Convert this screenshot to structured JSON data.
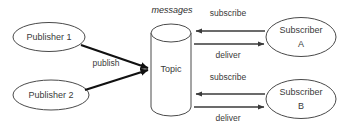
{
  "diagram": {
    "type": "publish-subscribe-messaging-diagram",
    "background_color": "#ffffff",
    "stroke_color": "#4a4a4a",
    "text_color": "#3a3a3a",
    "title": {
      "text": "messages",
      "style": "italic"
    },
    "nodes": [
      {
        "id": "publisher-1",
        "shape": "ellipse",
        "label": "Publisher 1",
        "cx": 49,
        "cy": 37,
        "rx": 36,
        "ry": 15
      },
      {
        "id": "publisher-2",
        "shape": "ellipse",
        "label": "Publisher 2",
        "cx": 51,
        "cy": 95,
        "rx": 38,
        "ry": 15
      },
      {
        "id": "topic",
        "shape": "cylinder",
        "label": "Topic",
        "x": 151,
        "y": 24,
        "width": 40,
        "height": 92
      },
      {
        "id": "subscriber-a",
        "shape": "ellipse",
        "label_line1": "Subscriber",
        "label_line2": "A",
        "cx": 301,
        "cy": 37,
        "rx": 35,
        "ry": 20
      },
      {
        "id": "subscriber-b",
        "shape": "ellipse",
        "label_line1": "Subscriber",
        "label_line2": "B",
        "cx": 301,
        "cy": 99,
        "rx": 35,
        "ry": 20
      }
    ],
    "edges": [
      {
        "id": "publish-from-publisher-1",
        "label": "publish",
        "from": "publisher-1",
        "to": "topic",
        "weight": "thick",
        "direction": "right"
      },
      {
        "id": "publish-from-publisher-2",
        "label": "",
        "from": "publisher-2",
        "to": "topic",
        "weight": "thick",
        "direction": "right"
      },
      {
        "id": "subscribe-a",
        "label": "subscribe",
        "from": "subscriber-a",
        "to": "topic",
        "weight": "thin",
        "direction": "left"
      },
      {
        "id": "deliver-a",
        "label": "deliver",
        "from": "topic",
        "to": "subscriber-a",
        "weight": "thin",
        "direction": "right"
      },
      {
        "id": "subscribe-b",
        "label": "subscribe",
        "from": "subscriber-b",
        "to": "topic",
        "weight": "thin",
        "direction": "left"
      },
      {
        "id": "deliver-b",
        "label": "deliver",
        "from": "topic",
        "to": "subscriber-b",
        "weight": "thin",
        "direction": "right"
      }
    ],
    "labels": {
      "publish": "publish",
      "subscribe_top": "subscribe",
      "deliver_top": "deliver",
      "subscribe_bottom": "subscribe",
      "deliver_bottom": "deliver",
      "messages": "messages",
      "publisher_1": "Publisher 1",
      "publisher_2": "Publisher 2",
      "topic": "Topic",
      "subscriber_a_line1": "Subscriber",
      "subscriber_a_line2": "A",
      "subscriber_b_line1": "Subscriber",
      "subscriber_b_line2": "B"
    }
  }
}
